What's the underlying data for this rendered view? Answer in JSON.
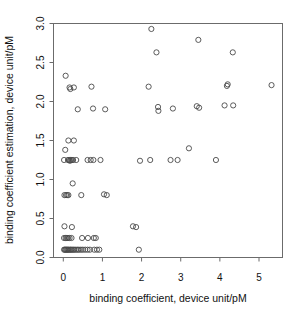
{
  "chart_data": {
    "type": "scatter",
    "title": "",
    "xlabel": "binding coefficient, device unit/pM",
    "ylabel": "binding coefficient estimation, device unit/pM",
    "xlim": [
      -0.25,
      5.6
    ],
    "ylim": [
      0.0,
      3.0
    ],
    "xticks": [
      0,
      1,
      2,
      3,
      4,
      5
    ],
    "xticklabels": [
      "0",
      "1",
      "2",
      "3",
      "4",
      "5"
    ],
    "yticks": [
      0.0,
      0.5,
      1.0,
      1.5,
      2.0,
      2.5,
      3.0
    ],
    "yticklabels": [
      "0.0",
      "0.5",
      "1.0",
      "1.5",
      "2.0",
      "2.5",
      "3.0"
    ],
    "grid": false,
    "legend": null,
    "marker": "open-circle",
    "marker_color": "#4a4a4a",
    "marker_radius_px": 2.6,
    "frame_color": "#6b6b6b",
    "background": "#ffffff",
    "points": [
      [
        0.06,
        2.33
      ],
      [
        0.16,
        2.18
      ],
      [
        0.18,
        2.16
      ],
      [
        0.27,
        2.18
      ],
      [
        0.72,
        2.19
      ],
      [
        2.18,
        2.19
      ],
      [
        4.18,
        2.2
      ],
      [
        4.2,
        2.22
      ],
      [
        5.32,
        2.21
      ],
      [
        2.25,
        2.93
      ],
      [
        2.38,
        2.63
      ],
      [
        3.45,
        2.79
      ],
      [
        4.33,
        2.63
      ],
      [
        0.37,
        1.9
      ],
      [
        0.76,
        1.91
      ],
      [
        1.07,
        1.9
      ],
      [
        2.42,
        1.93
      ],
      [
        2.43,
        1.88
      ],
      [
        2.8,
        1.91
      ],
      [
        3.41,
        1.94
      ],
      [
        3.47,
        1.92
      ],
      [
        4.12,
        1.95
      ],
      [
        4.34,
        1.95
      ],
      [
        0.13,
        1.5
      ],
      [
        0.27,
        1.5
      ],
      [
        0.05,
        1.38
      ],
      [
        3.21,
        1.4
      ],
      [
        0.02,
        1.25
      ],
      [
        0.12,
        1.25
      ],
      [
        0.15,
        1.25
      ],
      [
        0.17,
        1.24
      ],
      [
        0.19,
        1.25
      ],
      [
        0.22,
        1.25
      ],
      [
        0.25,
        1.25
      ],
      [
        0.33,
        1.25
      ],
      [
        0.62,
        1.25
      ],
      [
        0.7,
        1.25
      ],
      [
        0.77,
        1.25
      ],
      [
        0.95,
        1.25
      ],
      [
        1.96,
        1.24
      ],
      [
        2.22,
        1.25
      ],
      [
        2.74,
        1.25
      ],
      [
        2.92,
        1.25
      ],
      [
        3.9,
        1.25
      ],
      [
        0.24,
        0.95
      ],
      [
        0.03,
        0.8
      ],
      [
        0.07,
        0.8
      ],
      [
        0.1,
        0.8
      ],
      [
        0.13,
        0.8
      ],
      [
        0.46,
        0.8
      ],
      [
        1.04,
        0.81
      ],
      [
        1.11,
        0.8
      ],
      [
        0.03,
        0.4
      ],
      [
        0.22,
        0.39
      ],
      [
        1.78,
        0.4
      ],
      [
        1.86,
        0.39
      ],
      [
        0.02,
        0.25
      ],
      [
        0.06,
        0.25
      ],
      [
        0.09,
        0.25
      ],
      [
        0.12,
        0.25
      ],
      [
        0.16,
        0.25
      ],
      [
        0.21,
        0.25
      ],
      [
        0.48,
        0.25
      ],
      [
        0.63,
        0.25
      ],
      [
        0.78,
        0.25
      ],
      [
        0.83,
        0.25
      ],
      [
        0.02,
        0.1
      ],
      [
        0.04,
        0.1
      ],
      [
        0.06,
        0.1
      ],
      [
        0.08,
        0.1
      ],
      [
        0.1,
        0.1
      ],
      [
        0.12,
        0.1
      ],
      [
        0.14,
        0.1
      ],
      [
        0.17,
        0.1
      ],
      [
        0.19,
        0.1
      ],
      [
        0.22,
        0.1
      ],
      [
        0.25,
        0.1
      ],
      [
        0.28,
        0.1
      ],
      [
        0.32,
        0.1
      ],
      [
        0.36,
        0.1
      ],
      [
        0.4,
        0.1
      ],
      [
        0.45,
        0.1
      ],
      [
        0.5,
        0.1
      ],
      [
        0.56,
        0.1
      ],
      [
        0.62,
        0.1
      ],
      [
        0.68,
        0.1
      ],
      [
        0.79,
        0.1
      ],
      [
        0.86,
        0.1
      ],
      [
        0.92,
        0.1
      ],
      [
        1.93,
        0.1
      ]
    ]
  }
}
